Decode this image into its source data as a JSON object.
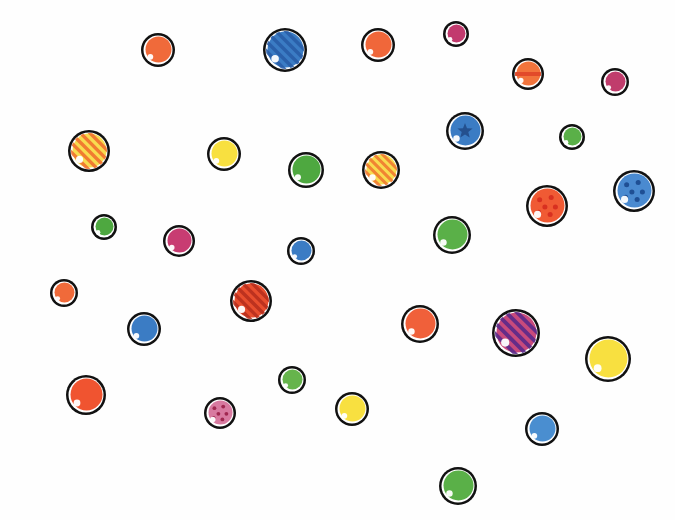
{
  "illustration": {
    "background": "#fefefe",
    "outline": "#111111",
    "balls": [
      {
        "x": 158,
        "y": 50,
        "r": 17,
        "color": "#f06a3a",
        "pattern": "plain"
      },
      {
        "x": 285,
        "y": 50,
        "r": 22,
        "color": "#3b7cc4",
        "pattern": "stripes",
        "accent": "#2a5ea8"
      },
      {
        "x": 378,
        "y": 45,
        "r": 17,
        "color": "#f0673a",
        "pattern": "plain"
      },
      {
        "x": 456,
        "y": 34,
        "r": 13,
        "color": "#c23a6e",
        "pattern": "plain"
      },
      {
        "x": 528,
        "y": 74,
        "r": 16,
        "color": "#f2743c",
        "pattern": "hstripe",
        "accent": "#e24a2a"
      },
      {
        "x": 615,
        "y": 82,
        "r": 14,
        "color": "#c03c6c",
        "pattern": "plain"
      },
      {
        "x": 89,
        "y": 151,
        "r": 21,
        "color": "#f8dc50",
        "pattern": "stripes",
        "accent": "#f0702e"
      },
      {
        "x": 224,
        "y": 154,
        "r": 17,
        "color": "#f8e040",
        "pattern": "plain"
      },
      {
        "x": 306,
        "y": 170,
        "r": 18,
        "color": "#4ea840",
        "pattern": "plain"
      },
      {
        "x": 381,
        "y": 170,
        "r": 19,
        "color": "#f8dc50",
        "pattern": "stripes",
        "accent": "#f07a30"
      },
      {
        "x": 465,
        "y": 131,
        "r": 19,
        "color": "#3b7cc4",
        "pattern": "star",
        "accent": "#24508e"
      },
      {
        "x": 572,
        "y": 137,
        "r": 13,
        "color": "#5ab048",
        "pattern": "plain"
      },
      {
        "x": 547,
        "y": 206,
        "r": 21,
        "color": "#f05a34",
        "pattern": "dots",
        "accent": "#d83020"
      },
      {
        "x": 634,
        "y": 191,
        "r": 21,
        "color": "#4a8ad0",
        "pattern": "dots",
        "accent": "#1f4f94"
      },
      {
        "x": 104,
        "y": 227,
        "r": 13,
        "color": "#4ea840",
        "pattern": "plain"
      },
      {
        "x": 179,
        "y": 241,
        "r": 16,
        "color": "#c83c72",
        "pattern": "plain"
      },
      {
        "x": 301,
        "y": 251,
        "r": 14,
        "color": "#3b7cc4",
        "pattern": "plain"
      },
      {
        "x": 452,
        "y": 235,
        "r": 19,
        "color": "#5ab048",
        "pattern": "plain"
      },
      {
        "x": 64,
        "y": 293,
        "r": 14,
        "color": "#f06a3a",
        "pattern": "plain"
      },
      {
        "x": 251,
        "y": 301,
        "r": 21,
        "color": "#e84e2e",
        "pattern": "stripes",
        "accent": "#b8301e"
      },
      {
        "x": 144,
        "y": 329,
        "r": 17,
        "color": "#3b7cc4",
        "pattern": "plain"
      },
      {
        "x": 420,
        "y": 324,
        "r": 19,
        "color": "#f0603a",
        "pattern": "plain"
      },
      {
        "x": 516,
        "y": 333,
        "r": 24,
        "color": "#c84a7c",
        "pattern": "stripes",
        "accent": "#5a2a8a"
      },
      {
        "x": 608,
        "y": 359,
        "r": 23,
        "color": "#f8e040",
        "pattern": "plain"
      },
      {
        "x": 86,
        "y": 395,
        "r": 20,
        "color": "#f05430",
        "pattern": "plain"
      },
      {
        "x": 220,
        "y": 413,
        "r": 16,
        "color": "#d87aa0",
        "pattern": "dots",
        "accent": "#a02850"
      },
      {
        "x": 292,
        "y": 380,
        "r": 14,
        "color": "#66b44c",
        "pattern": "plain"
      },
      {
        "x": 352,
        "y": 409,
        "r": 17,
        "color": "#f8e040",
        "pattern": "plain"
      },
      {
        "x": 542,
        "y": 429,
        "r": 17,
        "color": "#4a8ed0",
        "pattern": "plain"
      },
      {
        "x": 458,
        "y": 486,
        "r": 19,
        "color": "#5ab048",
        "pattern": "plain"
      }
    ]
  }
}
